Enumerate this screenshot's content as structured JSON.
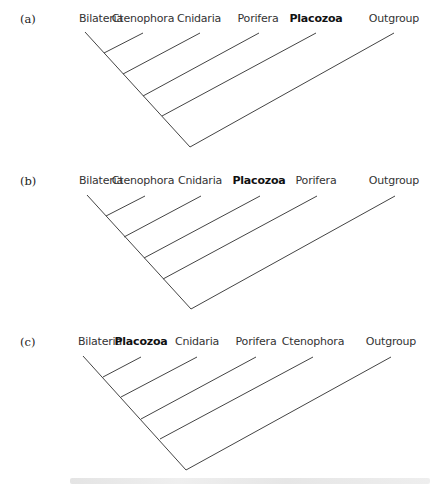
{
  "panels": [
    {
      "label": "(a)",
      "top": 0,
      "taxa": [
        {
          "name": "Bilateria",
          "x": 101,
          "bold": false
        },
        {
          "name": "Ctenophora",
          "x": 143,
          "bold": false
        },
        {
          "name": "Cnidaria",
          "x": 199,
          "bold": false
        },
        {
          "name": "Porifera",
          "x": 258,
          "bold": false
        },
        {
          "name": "Placozoa",
          "x": 316,
          "bold": true
        },
        {
          "name": "Outgroup",
          "x": 394,
          "bold": false
        }
      ],
      "tree": "(((((Bilateria,Ctenophora),Cnidaria),Porifera),Placozoa),Outgroup)"
    },
    {
      "label": "(b)",
      "top": 162,
      "taxa": [
        {
          "name": "Bilateria",
          "x": 101,
          "bold": false
        },
        {
          "name": "Ctenophora",
          "x": 143,
          "bold": false
        },
        {
          "name": "Cnidaria",
          "x": 200,
          "bold": false
        },
        {
          "name": "Placozoa",
          "x": 259,
          "bold": true
        },
        {
          "name": "Porifera",
          "x": 316,
          "bold": false
        },
        {
          "name": "Outgroup",
          "x": 394,
          "bold": false
        }
      ],
      "tree": "(((((Bilateria,Ctenophora),Cnidaria),Placozoa),Porifera),Outgroup)"
    },
    {
      "label": "(c)",
      "top": 323,
      "taxa": [
        {
          "name": "Bilateria",
          "x": 100,
          "bold": false
        },
        {
          "name": "Placozoa",
          "x": 141,
          "bold": true
        },
        {
          "name": "Cnidaria",
          "x": 197,
          "bold": false
        },
        {
          "name": "Porifera",
          "x": 256,
          "bold": false
        },
        {
          "name": "Ctenophora",
          "x": 313,
          "bold": false
        },
        {
          "name": "Outgroup",
          "x": 391,
          "bold": false
        }
      ],
      "tree": "(((((Bilateria,Placozoa),Cnidaria),Porifera),Ctenophora),Outgroup)"
    }
  ]
}
